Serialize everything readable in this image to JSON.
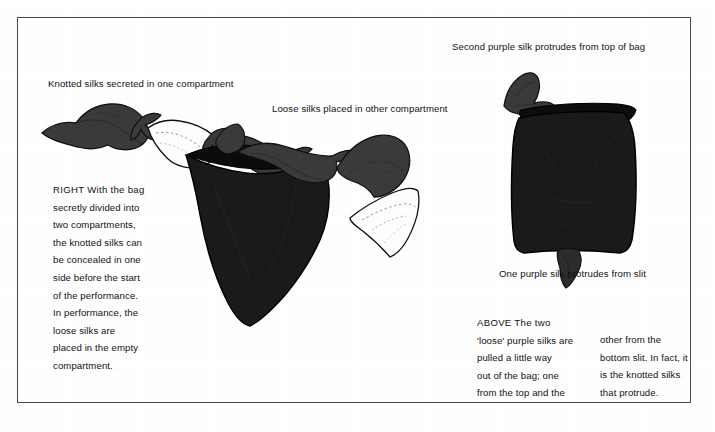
{
  "page": {
    "background_color": "#ffffff",
    "frame_color": "#4a4a4a"
  },
  "palette": {
    "silk_dark": "#3a3a3a",
    "silk_dark_shade": "#2c2c2c",
    "silk_white": "#fdfdfd",
    "bag_black": "#1a1a1a",
    "bag_black_interior": "#0d0d0d",
    "outline": "#111111",
    "text": "#111111"
  },
  "captions": [
    {
      "id": "knotted-silks",
      "text": "Knotted silks secreted in one compartment"
    },
    {
      "id": "loose-silks",
      "text": "Loose silks placed in other compartment"
    },
    {
      "id": "second-silk-top",
      "text": "Second purple silk protrudes from top of bag"
    },
    {
      "id": "one-silk-slit",
      "text": "One purple silk protrudes from slit"
    }
  ],
  "right_note": {
    "lead": "RIGHT",
    "lines": [
      "RIGHT  With the bag",
      "secretly divided into",
      "two compartments,",
      "the knotted silks can",
      "be concealed in one",
      "side before the start",
      "of the performance.",
      "In performance, the",
      "loose silks are",
      "placed in the empty",
      "compartment."
    ]
  },
  "above_note": {
    "lead": "ABOVE",
    "column_left": [
      "ABOVE  The two",
      "'loose' purple silks are",
      "pulled a little way",
      "out of the bag; one",
      "from the top and the"
    ],
    "column_right": [
      "other from the",
      "bottom slit. In fact, it",
      "is the knotted silks",
      "that protrude."
    ]
  },
  "figures": [
    {
      "id": "knotted-silk-chain",
      "label": "Three silks knotted together: dark, white, dark"
    },
    {
      "id": "left-bag",
      "label": "Open black bag with silk draped over the rim"
    },
    {
      "id": "loose-silk-dark",
      "label": "Loose dark purple silk"
    },
    {
      "id": "loose-silk-white",
      "label": "Loose white silk"
    },
    {
      "id": "right-bag",
      "label": "Closed black bag with silk at top and at bottom slit"
    }
  ]
}
